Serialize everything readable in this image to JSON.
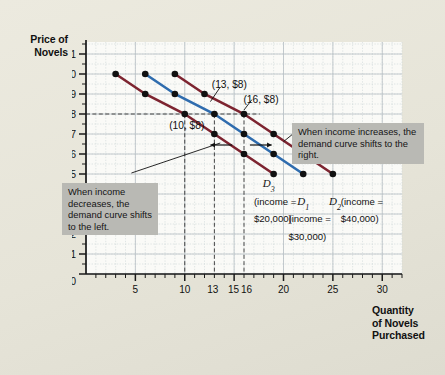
{
  "axes": {
    "ylabel": "Price of\nNovels",
    "ylabel_line1": "Price of",
    "ylabel_line2": "Novels",
    "xlabel_line1": "Quantity",
    "xlabel_line2": "of Novels",
    "xlabel_line3": "Purchased",
    "y_ticks": [
      "$11",
      "10",
      "9",
      "8",
      "7",
      "6",
      "5",
      "4",
      "3",
      "2",
      "1",
      "0"
    ],
    "x_ticks": [
      "0",
      "5",
      "10",
      "13",
      "15",
      "16",
      "20",
      "25",
      "30"
    ]
  },
  "annotations": {
    "note_right": "When income increases, the demand curve shifts to the right.",
    "note_left": "When income decreases, the demand curve shifts to the left.",
    "point_10": "(10, $8)",
    "point_13": "(13, $8)",
    "point_16": "(16, $8)",
    "curve3_name": "D",
    "curve3_sub": "3",
    "curve3_income_line1": "(income =",
    "curve3_income_line2": "$20,000)",
    "curve1_name": "D",
    "curve1_sub": "1",
    "curve1_income_line1": "(income =",
    "curve1_income_line2": "$30,000)",
    "curve2_name": "D",
    "curve2_sub": "2",
    "curve2_income_line1": "(income =",
    "curve2_income_line2": "$40,000)"
  },
  "colors": {
    "curve_red": "#7d2430",
    "curve_blue": "#2f6cae",
    "grid_minor": "#cfd6d9",
    "grid_major": "#b7bfc4",
    "plot_bg": "#fafaf7",
    "axis": "#1a1a1a",
    "note_bg": "#b9b9b4"
  },
  "chart_data": {
    "type": "line",
    "title": "",
    "xlabel": "Quantity of Novels Purchased",
    "ylabel": "Price of Novels",
    "xlim": [
      0,
      32
    ],
    "ylim": [
      0,
      11.6
    ],
    "grid": true,
    "legend": "inline-curve-labels",
    "xticks": [
      0,
      5,
      10,
      13,
      15,
      16,
      20,
      25,
      30
    ],
    "yticks": [
      0,
      1,
      2,
      3,
      4,
      5,
      6,
      7,
      8,
      9,
      10,
      11
    ],
    "guide_lines": {
      "horizontal": [
        8
      ],
      "vertical": [
        10,
        13,
        16
      ]
    },
    "series": [
      {
        "name": "D3",
        "label": "D3 (income = $20,000)",
        "income": 20000,
        "color": "#7d2430",
        "points": [
          {
            "q": 3,
            "p": 10
          },
          {
            "q": 6,
            "p": 9
          },
          {
            "q": 10,
            "p": 8
          },
          {
            "q": 13,
            "p": 7
          },
          {
            "q": 16,
            "p": 6
          },
          {
            "q": 19,
            "p": 5
          }
        ]
      },
      {
        "name": "D1",
        "label": "D1 (income = $30,000)",
        "income": 30000,
        "color": "#2f6cae",
        "points": [
          {
            "q": 6,
            "p": 10
          },
          {
            "q": 9,
            "p": 9
          },
          {
            "q": 13,
            "p": 8
          },
          {
            "q": 16,
            "p": 7
          },
          {
            "q": 19,
            "p": 6
          },
          {
            "q": 22,
            "p": 5
          }
        ]
      },
      {
        "name": "D2",
        "label": "D2 (income = $40,000)",
        "income": 40000,
        "color": "#7d2430",
        "points": [
          {
            "q": 9,
            "p": 10
          },
          {
            "q": 12,
            "p": 9
          },
          {
            "q": 16,
            "p": 8
          },
          {
            "q": 19,
            "p": 7
          },
          {
            "q": 22,
            "p": 6
          },
          {
            "q": 25,
            "p": 5
          }
        ]
      }
    ],
    "callouts": [
      {
        "text": "(10, $8)",
        "q": 10,
        "p": 8
      },
      {
        "text": "(13, $8)",
        "q": 13,
        "p": 8
      },
      {
        "text": "(16, $8)",
        "q": 16,
        "p": 8
      }
    ],
    "shift_arrows": [
      {
        "direction": "left",
        "p": 6.45,
        "from_q": 14.8,
        "to_q": 12.6
      },
      {
        "direction": "right",
        "p": 6.45,
        "from_q": 16.6,
        "to_q": 18.8
      }
    ]
  }
}
